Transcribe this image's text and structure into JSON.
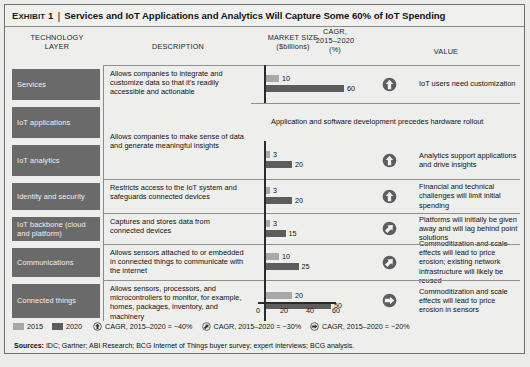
{
  "exhibit": {
    "label_prefix": "E",
    "label_rest": "XHIBIT",
    "number": "1",
    "divider": "|",
    "title": "Services and IoT Applications and Analytics Will Capture Some 60% of IoT Spending"
  },
  "columns": {
    "technology_layer_l1": "TECHNOLOGY",
    "technology_layer_l2": "LAYER",
    "description": "DESCRIPTION",
    "market_size_l1": "MARKET SIZE",
    "market_size_l2": "($billions)",
    "cagr_l1": "CAGR,",
    "cagr_l2": "2015–2020",
    "cagr_l3": "(%)",
    "value": "VALUE"
  },
  "rows": [
    {
      "layer": "Services",
      "description": "Allows companies to integrate and customize data so that it’s readily accessible and actionable",
      "v2015": 10,
      "v2020": 60,
      "label2015": "10",
      "label2020": "60",
      "cagr_icon": "arrow-up-icon",
      "cagr_band": "~40%",
      "value": "IoT users need customization"
    },
    {
      "layer": "IoT applications",
      "description": "Allows companies to make sense of data and generate meaningful insights",
      "v2015": 10,
      "v2020": 60,
      "label2015": "10",
      "label2020": "60",
      "cagr_icon": "arrow-up-icon",
      "cagr_band": "~40%",
      "value": "Application and software development precedes hardware rollout"
    },
    {
      "layer": "IoT analytics",
      "description": "",
      "v2015": 3,
      "v2020": 20,
      "label2015": "3",
      "label2020": "20",
      "cagr_icon": "arrow-up-icon",
      "cagr_band": "~40%",
      "value": "Analytics support applications and drive insights"
    },
    {
      "layer": "Identity and security",
      "description": "Restricts access to the IoT system and safeguards connected devices",
      "v2015": 3,
      "v2020": 20,
      "label2015": "3",
      "label2020": "20",
      "cagr_icon": "arrow-up-icon",
      "cagr_band": "~40%",
      "value": "Financial and technical challenges will limit initial spending"
    },
    {
      "layer": "IoT backbone (cloud and platform)",
      "description": "Captures and stores data from connected devices",
      "v2015": 3,
      "v2020": 15,
      "label2015": "3",
      "label2020": "15",
      "cagr_icon": "arrow-diagonal-icon",
      "cagr_band": "~30%",
      "value": "Platforms will initially be given away and will lag behind point solutions"
    },
    {
      "layer": "Communications",
      "description": "Allows sensors attached to or embedded in connected things to communicate with the internet",
      "v2015": 10,
      "v2020": 25,
      "label2015": "10",
      "label2020": "25",
      "cagr_icon": "arrow-diagonal-icon",
      "cagr_band": "~30%",
      "value": "Commoditization and scale effects will lead to price erosion; existing network infrastructure will likely be reused"
    },
    {
      "layer": "Connected things",
      "description": "Allows sensors, processors, and microcontrollers to monitor, for example, homes, packages, inventory, and machinery",
      "v2015": 20,
      "v2020": 50,
      "label2015": "20",
      "label2020": "50",
      "cagr_icon": "arrow-right-icon",
      "cagr_band": "~20%",
      "value": "Commoditization and scale effects will lead to price erosion in sensors"
    }
  ],
  "axis": {
    "ticks": [
      "0",
      "20",
      "40",
      "60"
    ],
    "min": 0,
    "max": 60
  },
  "legend": {
    "series": [
      {
        "label": "2015",
        "color": "#a8a8a8"
      },
      {
        "label": "2020",
        "color": "#5d5d5d"
      }
    ],
    "cagr_items": [
      {
        "icon": "arrow-up-icon",
        "label": "CAGR, 2015–2020 = ~40%"
      },
      {
        "icon": "arrow-diagonal-icon",
        "label": "CAGR, 2015–2020 = ~30%"
      },
      {
        "icon": "arrow-right-icon",
        "label": "CAGR, 2015–2020 = ~20%"
      }
    ]
  },
  "sources": {
    "label": "Sources:",
    "text": "IDC; Gartner; ABI Research; BCG Internet of Things buyer survey; expert interviews; BCG analysis."
  },
  "chart_data": {
    "type": "bar",
    "title": "Services and IoT Applications and Analytics Will Capture Some 60% of IoT Spending",
    "xlabel": "($billions)",
    "ylabel": "Technology layer",
    "xlim": [
      0,
      60
    ],
    "grid": false,
    "orientation": "horizontal",
    "legend_position": "bottom-left",
    "categories": [
      "Services",
      "IoT applications",
      "IoT analytics",
      "Identity and security",
      "IoT backbone (cloud and platform)",
      "Communications",
      "Connected things"
    ],
    "series": [
      {
        "name": "2015",
        "color": "#a8a8a8",
        "values": [
          10,
          10,
          3,
          3,
          3,
          10,
          20
        ]
      },
      {
        "name": "2020",
        "color": "#5d5d5d",
        "values": [
          60,
          60,
          20,
          20,
          15,
          25,
          50
        ]
      }
    ],
    "annotations": [
      {
        "category": "Services",
        "cagr": "~40%"
      },
      {
        "category": "IoT applications",
        "cagr": "~40%"
      },
      {
        "category": "IoT analytics",
        "cagr": "~40%"
      },
      {
        "category": "Identity and security",
        "cagr": "~40%"
      },
      {
        "category": "IoT backbone (cloud and platform)",
        "cagr": "~30%"
      },
      {
        "category": "Communications",
        "cagr": "~30%"
      },
      {
        "category": "Connected things",
        "cagr": "~20%"
      }
    ]
  }
}
